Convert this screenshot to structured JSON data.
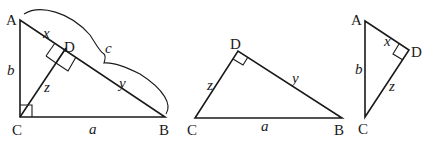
{
  "diagram": {
    "type": "geometry",
    "colors": {
      "stroke": "#1a1a1a",
      "background": "#ffffff"
    },
    "figures": [
      {
        "id": "triangle-ABC",
        "vertices": {
          "A": "A",
          "B": "B",
          "C": "C",
          "D": "D"
        },
        "sides": {
          "a": "a",
          "b": "b",
          "c": "c",
          "x": "x",
          "y": "y",
          "z": "z"
        },
        "right_angles": [
          "C",
          "D"
        ]
      },
      {
        "id": "triangle-CDB",
        "vertices": {
          "C": "C",
          "D": "D",
          "B": "B"
        },
        "sides": {
          "a": "a",
          "y": "y",
          "z": "z"
        },
        "right_angles": [
          "D"
        ]
      },
      {
        "id": "triangle-ADC",
        "vertices": {
          "A": "A",
          "D": "D",
          "C": "C"
        },
        "sides": {
          "b": "b",
          "x": "x",
          "z": "z"
        },
        "right_angles": [
          "D"
        ]
      }
    ]
  }
}
